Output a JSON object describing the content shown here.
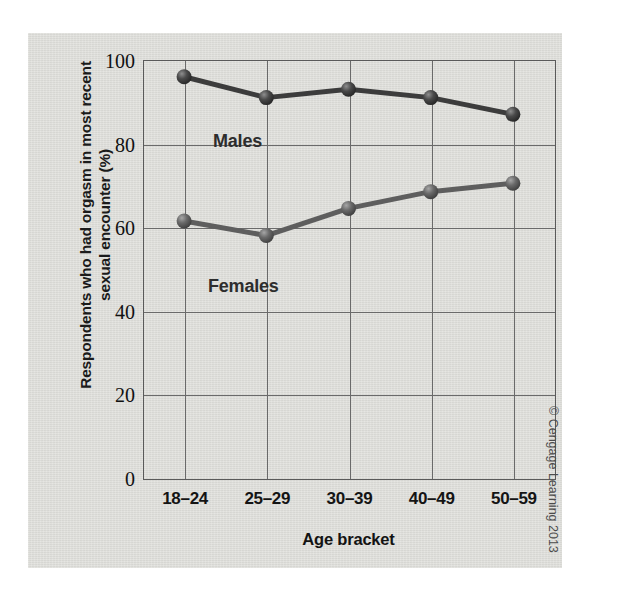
{
  "chart_data": {
    "type": "line",
    "title": "",
    "xlabel": "Age bracket",
    "ylabel_line1": "Respondents who had orgasm in most recent",
    "ylabel_line2": "sexual encounter (%)",
    "categories": [
      "18–24",
      "25–29",
      "30–39",
      "40–49",
      "50–59"
    ],
    "series": [
      {
        "name": "Males",
        "values": [
          96,
          91,
          93,
          91,
          87
        ],
        "color": "#3c3c3c",
        "label_position": "above-line-left"
      },
      {
        "name": "Females",
        "values": [
          61.5,
          58,
          64.5,
          68.5,
          70.5
        ],
        "color": "#5e5e5e",
        "label_position": "below-line-left"
      }
    ],
    "ylim": [
      0,
      100
    ],
    "yticks": [
      0,
      20,
      40,
      60,
      80,
      100
    ],
    "ytick_labels": [
      "0",
      "20",
      "40",
      "60",
      "80",
      "100"
    ],
    "grid": "both",
    "legend": "inline-annotations",
    "marker": "sphere",
    "background_color": "#dcdcd8",
    "axis_color": "#5a5a5a"
  },
  "credit": {
    "text": "© Cengage Learning 2013"
  }
}
